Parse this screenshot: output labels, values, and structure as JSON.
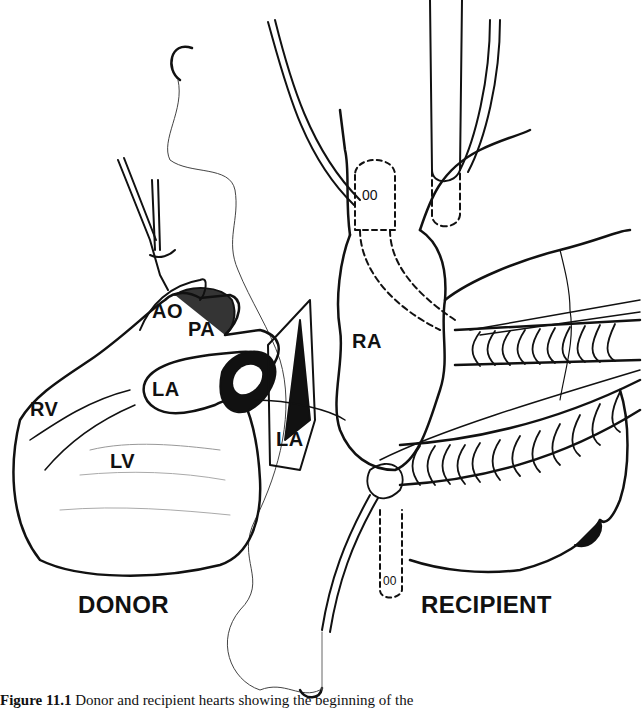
{
  "figure": {
    "labels": {
      "ao": "AO",
      "pa": "PA",
      "la_donor": "LA",
      "rv": "RV",
      "lv": "LV",
      "la_recipient": "LA",
      "ra": "RA",
      "donor": "DONOR",
      "recipient": "RECIPIENT"
    },
    "caption": {
      "number": "Figure 11.1",
      "text": "Donor and recipient hearts showing the beginning of the"
    }
  }
}
